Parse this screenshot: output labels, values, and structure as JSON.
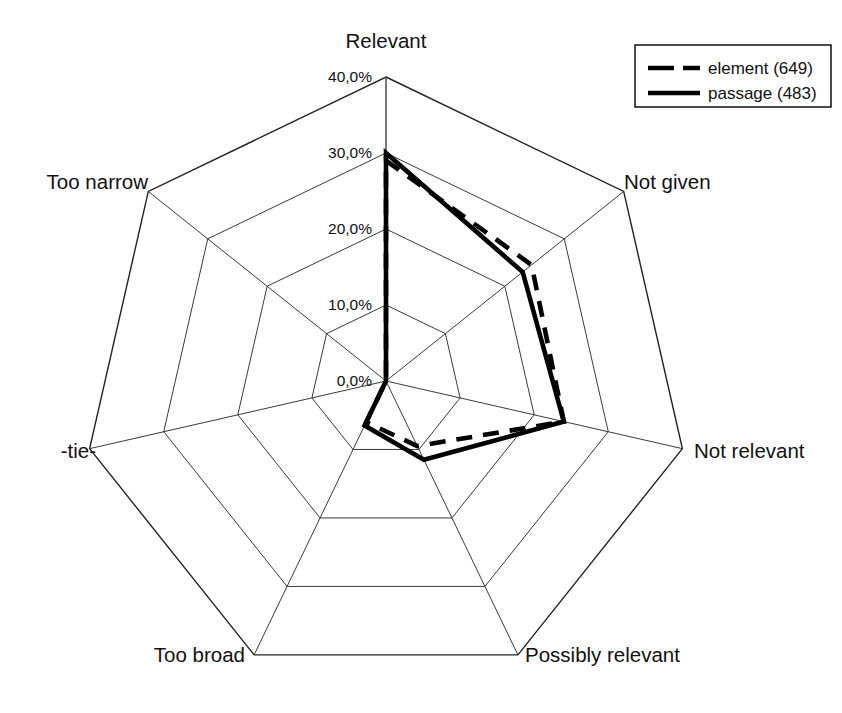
{
  "chart_data": {
    "type": "radar",
    "title": "",
    "categories": [
      "Relevant",
      "Not given",
      "Not relevant",
      "Possibly relevant",
      "Too broad",
      "-tie-",
      "Too narrow"
    ],
    "series": [
      {
        "name": "element (649)",
        "style": "dashed",
        "values": [
          29.0,
          24.5,
          24.0,
          9.5,
          6.0,
          0.0,
          0.0
        ]
      },
      {
        "name": "passage (483)",
        "style": "solid",
        "values": [
          30.0,
          23.0,
          24.0,
          11.5,
          6.5,
          0.0,
          0.0
        ]
      }
    ],
    "tick_labels": [
      "0,0%",
      "10,0%",
      "20,0%",
      "30,0%",
      "40,0%"
    ],
    "tick_values": [
      0,
      10,
      20,
      30,
      40
    ],
    "rlim": [
      0,
      40
    ],
    "grid": true,
    "legend_position": "top-right",
    "xlabel": "",
    "ylabel": "",
    "units": "%"
  },
  "legend": {
    "entries": [
      {
        "label": "element (649)",
        "style": "dashed"
      },
      {
        "label": "passage (483)",
        "style": "solid"
      }
    ]
  },
  "axis_labels": {
    "relevant": "Relevant",
    "not_given": "Not given",
    "not_relevant": "Not relevant",
    "possibly_relevant": "Possibly relevant",
    "too_broad": "Too broad",
    "tie": "-tie-",
    "too_narrow": "Too narrow"
  },
  "ticks": {
    "t0": "0,0%",
    "t1": "10,0%",
    "t2": "20,0%",
    "t3": "30,0%",
    "t4": "40,0%"
  },
  "colors": {
    "series": "#000000",
    "grid": "#3a3a3a",
    "background": "#ffffff"
  }
}
